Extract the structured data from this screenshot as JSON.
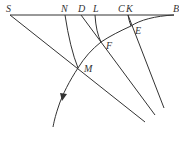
{
  "diagram": {
    "type": "geometric-construction",
    "labels": {
      "S": "S",
      "N": "N",
      "D": "D",
      "L": "L",
      "C": "C",
      "K": "K",
      "B": "B",
      "E": "E",
      "F": "F",
      "M": "M"
    },
    "colors": {
      "stroke": "#333333",
      "background": "#ffffff"
    },
    "elements": [
      {
        "id": "baseline",
        "kind": "line",
        "from": "S",
        "to": "B"
      },
      {
        "id": "line-S",
        "kind": "line",
        "from": "S",
        "through": "M"
      },
      {
        "id": "line-D",
        "kind": "line",
        "from": "D",
        "through": "F"
      },
      {
        "id": "line-K",
        "kind": "line",
        "from": "K",
        "through": "E"
      },
      {
        "id": "arc-N",
        "kind": "arc",
        "from": "N",
        "to": "M"
      },
      {
        "id": "arc-L",
        "kind": "arc",
        "from": "L",
        "to": "F"
      },
      {
        "id": "arc-C",
        "kind": "arc",
        "from": "C",
        "to": "E"
      },
      {
        "id": "trajectory",
        "kind": "curve",
        "from": "B",
        "through": [
          "E",
          "F",
          "M"
        ],
        "arrow": "downward"
      }
    ]
  }
}
